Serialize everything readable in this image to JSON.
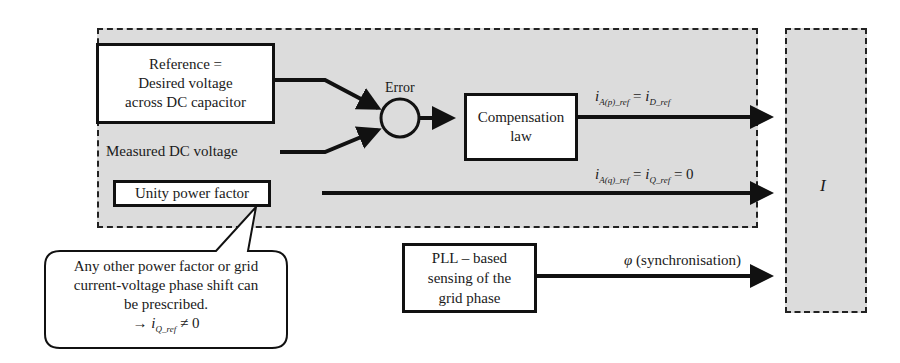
{
  "diagram": {
    "type": "control-block-diagram",
    "controller_region": {
      "fill": "#dcdcdc",
      "border": "dashed"
    },
    "output_block": {
      "label": "I",
      "fill": "#dcdcdc",
      "border": "dashed"
    },
    "reference_block": {
      "lines": [
        "Reference =",
        "Desired voltage",
        "across DC capacitor"
      ]
    },
    "measured_input": {
      "label": "Measured DC voltage"
    },
    "summing_junction": {
      "label": "Error"
    },
    "compensation_block": {
      "lines": [
        "Compensation",
        "law"
      ]
    },
    "unity_pf_block": {
      "label": "Unity power factor"
    },
    "pll_block": {
      "lines": [
        "PLL – based",
        "sensing of the",
        "grid phase"
      ]
    },
    "signals": {
      "active_ref": {
        "i": "i",
        "sub1": "A(p)_ref",
        "eq": " = ",
        "i2": "i",
        "sub2": "D_ref",
        "tail": ""
      },
      "reactive_ref": {
        "i": "i",
        "sub1": "A(q)_ref",
        "eq": " = ",
        "i2": "i",
        "sub2": "Q_ref",
        "tail": " = 0"
      },
      "phase": {
        "symbol": "φ",
        "text": " (synchronisation)"
      }
    },
    "callout": {
      "lines": [
        "Any other power factor or grid",
        "current-voltage phase shift can",
        "be prescribed."
      ],
      "formula": {
        "arrow": "→ ",
        "i": "i",
        "sub": "Q_ref",
        "tail": " ≠ 0"
      }
    }
  }
}
